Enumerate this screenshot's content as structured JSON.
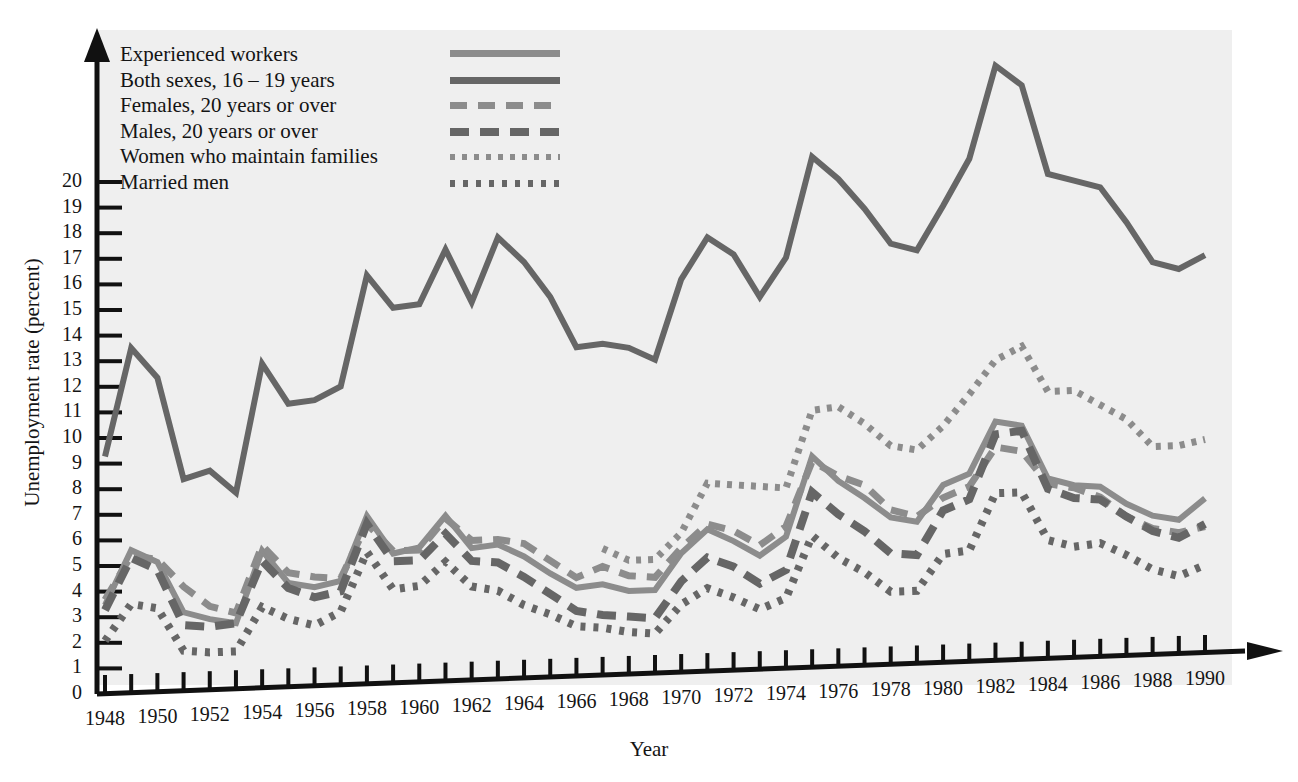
{
  "axes": {
    "ylabel": "Unemployment rate (percent)",
    "xlabel": "Year",
    "yticks": [
      "0",
      "1",
      "2",
      "3",
      "4",
      "5",
      "6",
      "7",
      "8",
      "9",
      "10",
      "11",
      "12",
      "13",
      "14",
      "15",
      "16",
      "17",
      "18",
      "19",
      "20"
    ],
    "xticks": [
      "1948",
      "1950",
      "1952",
      "1954",
      "1956",
      "1958",
      "1960",
      "1962",
      "1964",
      "1966",
      "1968",
      "1970",
      "1972",
      "1974",
      "1976",
      "1978",
      "1980",
      "1982",
      "1984",
      "1986",
      "1988",
      "1990"
    ]
  },
  "legend": {
    "items": [
      {
        "label": "Experienced workers",
        "style": "solid-light",
        "color": "#8c8c8c"
      },
      {
        "label": "Both sexes, 16 – 19 years",
        "style": "solid-dark",
        "color": "#666666"
      },
      {
        "label": "Females, 20 years or over",
        "style": "dash-light",
        "color": "#8c8c8c"
      },
      {
        "label": "Males, 20 years or over",
        "style": "dash-dark",
        "color": "#666666"
      },
      {
        "label": "Women who maintain families",
        "style": "dot-light",
        "color": "#8c8c8c"
      },
      {
        "label": "Married men",
        "style": "dot-dark",
        "color": "#666666"
      }
    ]
  },
  "chart_data": {
    "type": "line",
    "title": "",
    "xlabel": "Year",
    "ylabel": "Unemployment rate (percent)",
    "xlim": [
      1948,
      1990
    ],
    "ylim": [
      0,
      21
    ],
    "grid": false,
    "legend_position": "top-left",
    "x": [
      1948,
      1949,
      1950,
      1951,
      1952,
      1953,
      1954,
      1955,
      1956,
      1957,
      1958,
      1959,
      1960,
      1961,
      1962,
      1963,
      1964,
      1965,
      1966,
      1967,
      1968,
      1969,
      1970,
      1971,
      1972,
      1973,
      1974,
      1975,
      1976,
      1977,
      1978,
      1979,
      1980,
      1981,
      1982,
      1983,
      1984,
      1985,
      1986,
      1987,
      1988,
      1989,
      1990
    ],
    "series": [
      {
        "name": "Experienced workers",
        "style": "solid-light",
        "color": "#8c8c8c",
        "values": [
          3.4,
          5.5,
          5.0,
          3.0,
          2.7,
          2.5,
          5.3,
          4.0,
          3.8,
          4.0,
          6.5,
          5.0,
          5.2,
          6.4,
          5.1,
          5.2,
          4.7,
          4.0,
          3.4,
          3.5,
          3.2,
          3.2,
          4.6,
          5.5,
          5.0,
          4.4,
          5.1,
          8.2,
          7.2,
          6.5,
          5.7,
          5.5,
          6.9,
          7.3,
          9.3,
          9.1,
          7.0,
          6.7,
          6.6,
          5.9,
          5.4,
          5.2,
          6.0
        ]
      },
      {
        "name": "Both sexes, 16 – 19 years",
        "style": "solid-dark",
        "color": "#666666",
        "values": [
          9.2,
          13.4,
          12.2,
          8.2,
          8.5,
          7.6,
          12.6,
          11.0,
          11.1,
          11.6,
          15.9,
          14.6,
          14.7,
          16.8,
          14.7,
          17.2,
          16.2,
          14.8,
          12.8,
          12.9,
          12.7,
          12.2,
          15.3,
          16.9,
          16.2,
          14.5,
          16.0,
          19.9,
          19.0,
          17.8,
          16.4,
          16.1,
          17.8,
          19.6,
          23.2,
          22.4,
          18.9,
          18.6,
          18.3,
          16.9,
          15.3,
          15.0,
          15.5
        ]
      },
      {
        "name": "Females, 20 years or over",
        "style": "dash-light",
        "color": "#8c8c8c",
        "values": [
          3.6,
          5.3,
          5.1,
          4.0,
          3.2,
          2.9,
          5.5,
          4.4,
          4.2,
          4.1,
          6.2,
          5.1,
          5.1,
          6.3,
          5.4,
          5.4,
          5.2,
          4.5,
          3.8,
          4.2,
          3.8,
          3.7,
          4.8,
          5.7,
          5.4,
          4.8,
          5.5,
          8.0,
          7.4,
          7.0,
          6.0,
          5.7,
          6.4,
          6.8,
          8.3,
          8.1,
          6.8,
          6.6,
          6.2,
          5.4,
          4.9,
          4.7,
          4.9
        ]
      },
      {
        "name": "Males, 20 years or over",
        "style": "dash-dark",
        "color": "#666666",
        "values": [
          3.2,
          5.2,
          4.7,
          2.5,
          2.4,
          2.5,
          4.9,
          3.8,
          3.4,
          3.6,
          6.2,
          4.7,
          4.7,
          5.7,
          4.6,
          4.5,
          3.9,
          3.2,
          2.5,
          2.3,
          2.2,
          2.1,
          3.5,
          4.4,
          4.0,
          3.3,
          3.8,
          6.8,
          5.9,
          5.2,
          4.3,
          4.2,
          5.9,
          6.3,
          8.8,
          8.9,
          6.6,
          6.2,
          6.1,
          5.4,
          4.8,
          4.5,
          5.0
        ]
      },
      {
        "name": "Women who maintain families",
        "style": "dot-light",
        "color": "#8c8c8c",
        "values": [
          null,
          null,
          null,
          null,
          null,
          null,
          null,
          null,
          null,
          null,
          null,
          null,
          null,
          null,
          null,
          null,
          null,
          null,
          null,
          4.9,
          4.4,
          4.4,
          5.4,
          7.3,
          7.2,
          7.1,
          7.0,
          10.0,
          10.1,
          9.4,
          8.5,
          8.3,
          9.2,
          10.4,
          11.7,
          12.2,
          10.4,
          10.4,
          9.8,
          9.2,
          8.1,
          8.1,
          8.3
        ]
      },
      {
        "name": "Married men",
        "style": "dot-dark",
        "color": "#666666",
        "values": [
          2.0,
          3.4,
          3.2,
          1.5,
          1.4,
          1.4,
          3.1,
          2.6,
          2.3,
          2.8,
          5.1,
          3.6,
          3.7,
          4.6,
          3.6,
          3.4,
          2.8,
          2.4,
          1.9,
          1.8,
          1.6,
          1.5,
          2.6,
          3.2,
          2.8,
          2.3,
          2.7,
          5.1,
          4.2,
          3.6,
          2.8,
          2.8,
          4.2,
          4.3,
          6.5,
          6.5,
          4.6,
          4.3,
          4.4,
          3.9,
          3.3,
          3.0,
          3.4
        ]
      }
    ]
  }
}
